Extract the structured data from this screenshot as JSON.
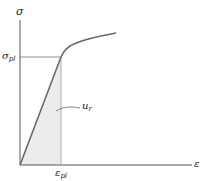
{
  "diagram": {
    "axes": {
      "y_label": "σ",
      "x_label": "ε"
    },
    "markers": {
      "stress_pl_symbol": "σ",
      "stress_pl_subscript": "pl",
      "strain_pl_symbol": "ε",
      "strain_pl_subscript": "pl"
    },
    "region": {
      "label_symbol": "u",
      "label_subscript": "r",
      "fill_color": "#ececec"
    },
    "colors": {
      "axis": "#555555",
      "curve": "#6a6a6a",
      "guide": "#777777"
    }
  }
}
